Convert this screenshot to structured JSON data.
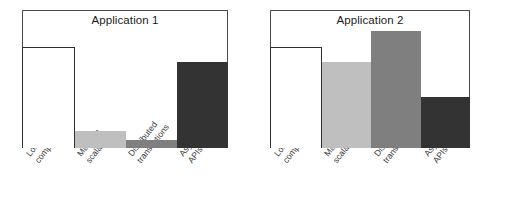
{
  "figure": {
    "title": "",
    "background": "#ffffff"
  },
  "palette": {
    "outline_stroke": "#2f2f2f",
    "frame_stroke": "#4a4a4a",
    "white_bar": "#ffffff",
    "light_gray_bar": "#bfbfbf",
    "medium_gray_bar": "#7f7f7f",
    "dark_gray_bar": "#333333",
    "text": "#1b1b1b"
  },
  "chart_data": [
    {
      "type": "bar",
      "title": "Application 1",
      "xlabel": "",
      "ylabel": "",
      "ylim": [
        0,
        100
      ],
      "grid": false,
      "legend": "none",
      "categories": [
        "Loosely coupled components",
        "Massive scalability",
        "Distributed transactions",
        "Asynchorous APIs"
      ],
      "category_lines": [
        [
          "Loosely coupled",
          "components"
        ],
        [
          "Massive",
          "scalability"
        ],
        [
          "Distributed",
          "transactions"
        ],
        [
          "Asynchorous",
          "APIs"
        ]
      ],
      "values": [
        73,
        12,
        6,
        62
      ],
      "bar_colors": [
        "#ffffff",
        "#bfbfbf",
        "#7f7f7f",
        "#333333"
      ],
      "bar_styles": [
        "outline",
        "solid",
        "solid",
        "solid"
      ]
    },
    {
      "type": "bar",
      "title": "Application 2",
      "xlabel": "",
      "ylabel": "",
      "ylim": [
        0,
        100
      ],
      "grid": false,
      "legend": "none",
      "categories": [
        "Loosely coupled components",
        "Massive scalability",
        "Distributed transactions",
        "Asynchorous APIs"
      ],
      "category_lines": [
        [
          "Loosely coupled",
          "components"
        ],
        [
          "Massive",
          "scalability"
        ],
        [
          "Distributed",
          "transactions"
        ],
        [
          "Asynchorous",
          "APIs"
        ]
      ],
      "values": [
        73,
        62,
        85,
        37
      ],
      "bar_colors": [
        "#ffffff",
        "#bfbfbf",
        "#7f7f7f",
        "#333333"
      ],
      "bar_styles": [
        "outline",
        "solid",
        "solid",
        "solid"
      ]
    }
  ]
}
